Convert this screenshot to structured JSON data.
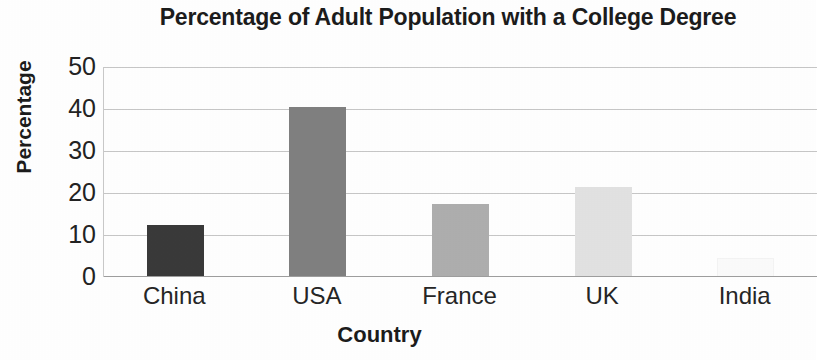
{
  "chart_data": {
    "type": "bar",
    "title": "Percentage of Adult Population with a College Degree",
    "xlabel": "Country",
    "ylabel": "Percentage",
    "categories": [
      "China",
      "USA",
      "France",
      "UK",
      "India"
    ],
    "values": [
      12.5,
      40.5,
      17.5,
      21.5,
      4.5
    ],
    "bar_colors": [
      "#3a3a3a",
      "#808080",
      "#aeaeae",
      "#e2e2e2",
      "#fbfbfb"
    ],
    "ylim": [
      0,
      50
    ],
    "ytick_labels": [
      "50",
      "40",
      "30",
      "20",
      "10",
      "0"
    ],
    "ytick_values": [
      50,
      40,
      30,
      20,
      10,
      0
    ],
    "grid": "horizontal",
    "legend": "none",
    "gridline_color": "#c7c7c7",
    "axis_color": "#9e9e9e",
    "background": "#ffffff",
    "text_color": "#1c1c1c"
  }
}
